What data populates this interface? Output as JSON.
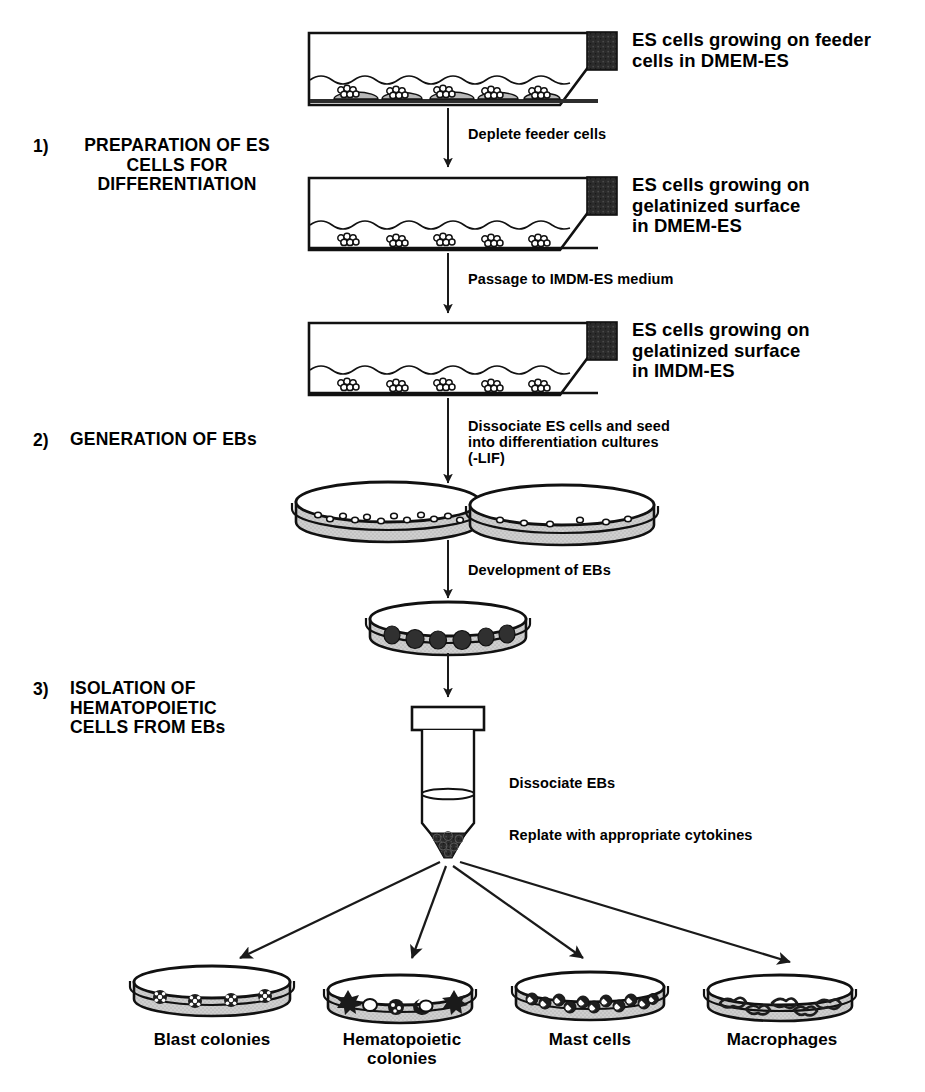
{
  "figure": {
    "width": 925,
    "height": 1092,
    "background": "#ffffff",
    "ink": "#000000",
    "dish_fill": "#c9c9c9",
    "cap_fill": "#2a2a2a"
  },
  "steps": [
    {
      "number": "1)",
      "label": "PREPARATION OF ES\nCELLS FOR\nDIFFERENTIATION"
    },
    {
      "number": "2)",
      "label": "GENERATION OF EBs"
    },
    {
      "number": "3)",
      "label": "ISOLATION OF\nHEMATOPOIETIC\nCELLS FROM EBs"
    }
  ],
  "vessel_labels": [
    {
      "text": "ES cells growing on feeder\ncells in DMEM-ES"
    },
    {
      "text": "ES cells growing on\ngelatinized surface\nin DMEM-ES"
    },
    {
      "text": "ES cells growing on\ngelatinized surface\nin IMDM-ES"
    }
  ],
  "flow_labels": [
    {
      "text": "Deplete feeder cells"
    },
    {
      "text": "Passage to IMDM-ES medium"
    },
    {
      "text": "Dissociate ES cells and seed\ninto differentiation cultures\n(-LIF)"
    },
    {
      "text": "Development of EBs"
    },
    {
      "text": "Dissociate EBs"
    },
    {
      "text": "Replate with appropriate cytokines"
    }
  ],
  "outputs": [
    {
      "label": "Blast colonies",
      "cell_type": "blast-colony"
    },
    {
      "label": "Hematopoietic\ncolonies",
      "cell_type": "hematopoietic-colony"
    },
    {
      "label": "Mast cells",
      "cell_type": "mast-cell"
    },
    {
      "label": "Macrophages",
      "cell_type": "macrophage"
    }
  ],
  "icons": {
    "flask": "culture-flask-icon",
    "dish": "petri-dish-icon",
    "tube": "centrifuge-tube-icon",
    "arrow": "down-arrow-icon"
  }
}
